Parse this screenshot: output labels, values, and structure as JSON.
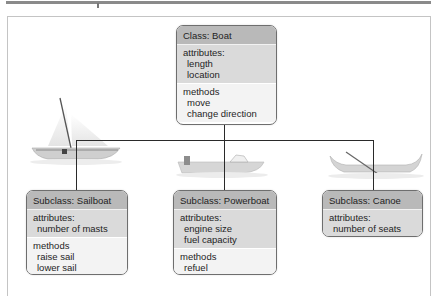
{
  "diagram": {
    "colors": {
      "header_bg": "#b9b9b9",
      "attributes_bg": "#dadada",
      "methods_bg": "#f3f3f3",
      "connector": "#2a2a2a",
      "border": "#6e6e6e"
    },
    "parent": {
      "title": "Class: Boat",
      "attributes_label": "attributes:",
      "attributes": [
        "length",
        "location"
      ],
      "methods_label": "methods",
      "methods": [
        "move",
        "change direction"
      ]
    },
    "children": [
      {
        "title": "Subclass: Sailboat",
        "image": "sailboat-icon",
        "attributes_label": "attributes:",
        "attributes": [
          "number of masts"
        ],
        "methods_label": "methods",
        "methods": [
          "raise sail",
          "lower sail"
        ]
      },
      {
        "title": "Subclass: Powerboat",
        "image": "powerboat-icon",
        "attributes_label": "attributes:",
        "attributes": [
          "engine size",
          "fuel capacity"
        ],
        "methods_label": "methods",
        "methods": [
          "refuel"
        ]
      },
      {
        "title": "Subclass: Canoe",
        "image": "canoe-icon",
        "attributes_label": "attributes:",
        "attributes": [
          "number of seats"
        ]
      }
    ]
  }
}
